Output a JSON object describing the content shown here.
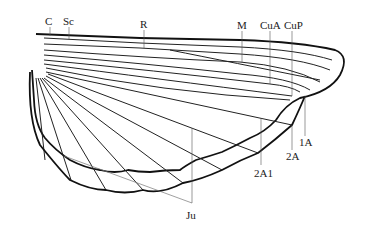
{
  "diagram": {
    "type": "insect-wing-venation",
    "labels": [
      {
        "id": "C",
        "text": "C",
        "x": 50,
        "y": 25
      },
      {
        "id": "Sc",
        "text": "Sc",
        "x": 69,
        "y": 25
      },
      {
        "id": "R",
        "text": "R",
        "x": 144,
        "y": 28
      },
      {
        "id": "M",
        "text": "M",
        "x": 242,
        "y": 29
      },
      {
        "id": "CuA",
        "text": "CuA",
        "x": 270,
        "y": 29
      },
      {
        "id": "CuP",
        "text": "CuP",
        "x": 292,
        "y": 29
      },
      {
        "id": "1A",
        "text": "1A",
        "x": 304,
        "y": 146
      },
      {
        "id": "2A",
        "text": "2A",
        "x": 292,
        "y": 160
      },
      {
        "id": "2A1",
        "text": "2A1",
        "x": 261,
        "y": 177
      },
      {
        "id": "Ju",
        "text": "Ju",
        "x": 192,
        "y": 219
      }
    ],
    "stroke_color": "#222222",
    "background": "#ffffff"
  }
}
